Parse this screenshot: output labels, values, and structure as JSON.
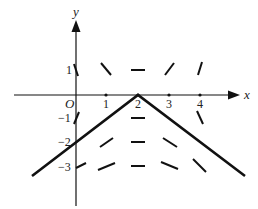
{
  "figure": {
    "type": "slope-field-diagram",
    "axes": {
      "x_label": "x",
      "y_label": "y",
      "origin_label": "O",
      "x_ticks": [
        {
          "value": 1,
          "label": "1"
        },
        {
          "value": 2,
          "label": "2"
        },
        {
          "value": 3,
          "label": "3"
        },
        {
          "value": 4,
          "label": "4"
        }
      ],
      "y_ticks": [
        {
          "value": 1,
          "label": "1"
        },
        {
          "value": -1,
          "label": "−1"
        },
        {
          "value": -2,
          "label": "−2"
        },
        {
          "value": -3,
          "label": "−3"
        }
      ]
    },
    "solution_curve": {
      "description": "V-shaped (inverted) polyline with apex at (2,0)",
      "points": [
        [
          -1.4,
          -3.2
        ],
        [
          2,
          0
        ],
        [
          5.4,
          -3.2
        ]
      ]
    },
    "slope_segments": [
      {
        "x": 0,
        "y": 1,
        "slope": "steep-negative"
      },
      {
        "x": 1,
        "y": 1,
        "slope": "negative"
      },
      {
        "x": 2,
        "y": 1,
        "slope": "zero"
      },
      {
        "x": 3,
        "y": 1,
        "slope": "positive"
      },
      {
        "x": 4,
        "y": 1,
        "slope": "steep-positive"
      },
      {
        "x": 0,
        "y": -1,
        "slope": "steep-positive"
      },
      {
        "x": 2,
        "y": -1,
        "slope": "zero"
      },
      {
        "x": 4,
        "y": -1,
        "slope": "steep-negative"
      },
      {
        "x": 1,
        "y": -2,
        "slope": "positive"
      },
      {
        "x": 2,
        "y": -2,
        "slope": "zero"
      },
      {
        "x": 3,
        "y": -2,
        "slope": "negative"
      },
      {
        "x": 0,
        "y": -3,
        "slope": "positive-shallow"
      },
      {
        "x": 1,
        "y": -3,
        "slope": "positive-shallow"
      },
      {
        "x": 2,
        "y": -3,
        "slope": "zero"
      },
      {
        "x": 3,
        "y": -3,
        "slope": "negative-shallow"
      },
      {
        "x": 4,
        "y": -3,
        "slope": "negative"
      }
    ],
    "colors": {
      "ink": "#111111",
      "background": "#ffffff"
    }
  }
}
